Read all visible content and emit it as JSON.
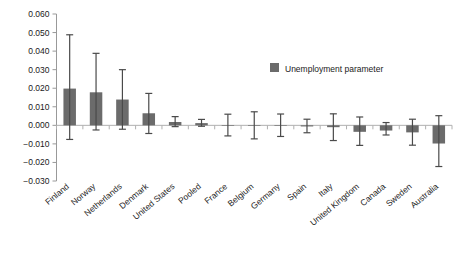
{
  "chart_data": {
    "type": "bar",
    "title": "",
    "subtitle": "",
    "xlabel": "",
    "ylabel": "",
    "ylim": [
      -0.03,
      0.06
    ],
    "ytick_step": 0.01,
    "ytick_labels": [
      "0.060",
      "0.050",
      "0.040",
      "0.030",
      "0.020",
      "0.010",
      "0.000",
      "-0.010",
      "-0.020",
      "-0.030"
    ],
    "ytick_values": [
      0.06,
      0.05,
      0.04,
      0.03,
      0.02,
      0.01,
      0.0,
      -0.01,
      -0.02,
      -0.03
    ],
    "grid": false,
    "zero_line": true,
    "legend": {
      "position": "top-right-inside",
      "entries": [
        {
          "label": "Unemployment parameter",
          "color": "#6b6b6b",
          "marker": "square"
        }
      ]
    },
    "error_bars": {
      "style": "capped",
      "color": "#4a4a4a"
    },
    "categories": [
      "Finland",
      "Norway",
      "Netherlands",
      "Denmark",
      "United States",
      "Pooled",
      "France",
      "Belgium",
      "Germany",
      "Spain",
      "Italy",
      "United Kingdom",
      "Canada",
      "Sweden",
      "Australia"
    ],
    "series": [
      {
        "name": "Unemployment parameter",
        "color": "#6b6b6b",
        "values": [
          0.0198,
          0.0178,
          0.0139,
          0.0065,
          0.0018,
          0.0012,
          0.0001,
          0.0001,
          0.0001,
          -0.0006,
          -0.001,
          -0.0035,
          -0.0028,
          -0.0038,
          -0.0098
        ],
        "err_low": [
          -0.0076,
          -0.0025,
          -0.0021,
          -0.0044,
          -0.0007,
          -0.0005,
          -0.0057,
          -0.0073,
          -0.006,
          -0.004,
          -0.0082,
          -0.0108,
          -0.0052,
          -0.0107,
          -0.0222
        ],
        "err_high": [
          0.0488,
          0.0388,
          0.03,
          0.0172,
          0.0047,
          0.0032,
          0.006,
          0.0073,
          0.0061,
          0.0033,
          0.0062,
          0.0045,
          0.0015,
          0.0033,
          0.0052
        ]
      }
    ]
  },
  "axis": {
    "zero_label": "0.000"
  }
}
